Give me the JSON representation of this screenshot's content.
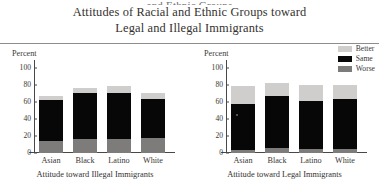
{
  "title": {
    "cut_line": "and Ethnic Groups",
    "line1": "Attitudes of Racial and Ethnic Groups toward",
    "line2": "Legal and Illegal Immigrants"
  },
  "legend": {
    "items": [
      {
        "label": "Better",
        "color": "#cfcecd"
      },
      {
        "label": "Same",
        "color": "#070707"
      },
      {
        "label": "Worse",
        "color": "#7e7c7b"
      }
    ]
  },
  "panels": {
    "left": {
      "axis_title": "Percent",
      "caption": "Attitude toward Illegal Immigrants"
    },
    "right": {
      "axis_title": "Percent",
      "caption": "Attitude toward Legal Immigrants"
    }
  },
  "yticks": [
    "0",
    "20",
    "40",
    "60",
    "80",
    "100"
  ],
  "chart_data": [
    {
      "type": "bar",
      "id": "illegal-immigrants",
      "title": "Attitude toward Illegal Immigrants",
      "stacked": true,
      "categories": [
        "Asian",
        "Black",
        "Latino",
        "White"
      ],
      "series": [
        {
          "name": "Worse",
          "color": "#7e7c7b",
          "values": [
            14,
            16,
            16,
            18
          ]
        },
        {
          "name": "Same",
          "color": "#070707",
          "values": [
            49,
            55,
            55,
            46
          ]
        },
        {
          "name": "Better",
          "color": "#cfcecd",
          "values": [
            5,
            6,
            8,
            7
          ]
        }
      ],
      "segment_tops": [
        [
          14,
          63,
          68
        ],
        [
          16,
          71,
          77
        ],
        [
          16,
          71,
          79
        ],
        [
          18,
          64,
          71
        ]
      ],
      "xlabel": "Attitude toward Illegal Immigrants",
      "ylabel": "Percent",
      "ylim": [
        0,
        110
      ],
      "ytick_values": [
        0,
        20,
        40,
        60,
        80,
        100
      ],
      "grid": false,
      "legend_position": "none"
    },
    {
      "type": "bar",
      "id": "legal-immigrants",
      "title": "Attitude toward Legal Immigrants",
      "stacked": true,
      "categories": [
        "Asian",
        "Black",
        "Latino",
        "White"
      ],
      "series": [
        {
          "name": "Worse",
          "color": "#7e7c7b",
          "values": [
            4,
            6,
            5,
            5
          ]
        },
        {
          "name": "Same",
          "color": "#070707",
          "values": [
            54,
            61,
            56,
            59
          ]
        },
        {
          "name": "Better",
          "color": "#cfcecd",
          "values": [
            21,
            16,
            20,
            16
          ]
        }
      ],
      "segment_tops": [
        [
          4,
          58,
          79
        ],
        [
          6,
          67,
          83
        ],
        [
          5,
          61,
          81
        ],
        [
          5,
          64,
          80
        ]
      ],
      "xlabel": "Attitude toward Legal Immigrants",
      "ylabel": "Percent",
      "ylim": [
        0,
        110
      ],
      "ytick_values": [
        0,
        20,
        40,
        60,
        80,
        100
      ],
      "grid": false,
      "legend_position": "top-right"
    }
  ]
}
